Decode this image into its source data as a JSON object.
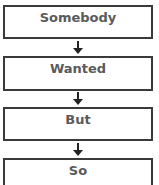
{
  "diagram": {
    "type": "vertical-flowchart",
    "steps": [
      {
        "label": "Somebody"
      },
      {
        "label": "Wanted"
      },
      {
        "label": "But"
      },
      {
        "label": "So"
      }
    ],
    "connectors": [
      "down-arrow",
      "down-arrow",
      "down-arrow"
    ],
    "colors": {
      "border": "#3a3a3a",
      "text": "#5a5a5a",
      "arrow": "#222222",
      "background": "#ffffff"
    }
  }
}
